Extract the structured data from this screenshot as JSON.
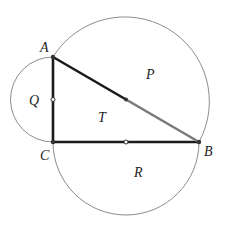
{
  "diagram": {
    "colors": {
      "background": "#ffffff",
      "triangle_stroke": "#1a1a1a",
      "hypotenuse_light": "#7a7a7a",
      "arc_stroke": "#8c8c8c",
      "point_fill": "#333333",
      "label_color": "#222222"
    },
    "points": {
      "A": {
        "label": "A",
        "x": 53,
        "y": 57
      },
      "B": {
        "label": "B",
        "x": 199,
        "y": 142
      },
      "C": {
        "label": "C",
        "x": 53,
        "y": 142
      }
    },
    "midpoints": {
      "AC": {
        "x": 53,
        "y": 99.5
      },
      "CB": {
        "x": 126,
        "y": 142
      },
      "AB": {
        "x": 126,
        "y": 99.5
      }
    },
    "regions": {
      "P": {
        "label": "P",
        "x": 150,
        "y": 77,
        "meaning": "semicircle on hypotenuse AB"
      },
      "Q": {
        "label": "Q",
        "x": 30,
        "y": 104,
        "meaning": "semicircle on leg AC"
      },
      "R": {
        "label": "R",
        "x": 136,
        "y": 174,
        "meaning": "semicircle on leg CB"
      },
      "T": {
        "label": "T",
        "x": 100,
        "y": 120,
        "meaning": "triangle ABC"
      }
    },
    "vertex_labels": {
      "A": {
        "label": "A",
        "x": 40,
        "y": 52
      },
      "B": {
        "label": "B",
        "x": 204,
        "y": 155
      },
      "C": {
        "label": "C",
        "x": 40,
        "y": 160
      }
    }
  }
}
